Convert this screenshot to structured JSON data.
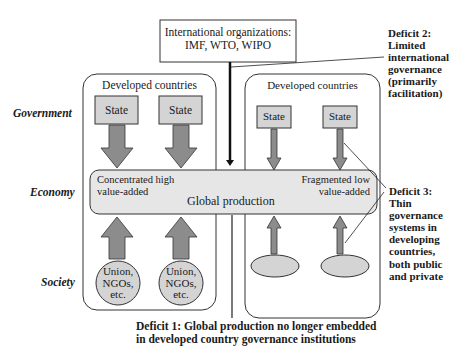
{
  "row_labels": {
    "government": "Government",
    "economy": "Economy",
    "society": "Society"
  },
  "international_box": {
    "line1": "International organizations:",
    "line2": "IMF, WTO, WIPO"
  },
  "left_region": {
    "title": "Developed countries",
    "states": [
      "State",
      "State"
    ],
    "societies": [
      {
        "line1": "Union,",
        "line2": "NGOs,",
        "line3": "etc."
      },
      {
        "line1": "Union,",
        "line2": "NGOs,",
        "line3": "etc."
      }
    ]
  },
  "right_region": {
    "title": "Developed countries",
    "states": [
      "State",
      "State"
    ]
  },
  "economy_band": {
    "left_line1": "Concentrated high",
    "left_line2": "value-added",
    "center": "Global production",
    "right_line1": "Fragmented low",
    "right_line2": "value-added"
  },
  "deficits": {
    "deficit1_line1": "Deficit 1: Global production no longer embedded",
    "deficit1_line2": "in developed country governance institutions",
    "deficit2": [
      "Deficit 2:",
      "Limited",
      "international",
      "governance",
      "(primarily",
      "facilitation)"
    ],
    "deficit3": [
      "Deficit 3:",
      "Thin",
      "governance",
      "systems in",
      "developing",
      "countries,",
      "both public",
      "and private"
    ]
  },
  "colors": {
    "box_fill": "#d4d4d4",
    "band_fill": "#e6e6e6",
    "arrow_fill": "#8c8c8c",
    "stroke": "#222222"
  }
}
